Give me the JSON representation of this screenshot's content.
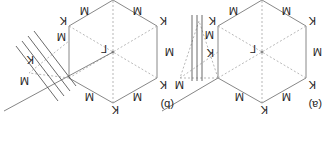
{
  "figure": {
    "orientation": "rotated-180",
    "panels": [
      {
        "id": "a",
        "label": "(a)",
        "center_label": "Γ",
        "vertex_label": "K",
        "edge_midpoint_label": "M",
        "cut_lines": "vertical (parallel to Γ-K... three parallel lines)",
        "triangle_labels": [
          "K",
          "M",
          "M",
          "M",
          "K"
        ]
      },
      {
        "id": "b",
        "label": "(b)",
        "center_label": "Γ",
        "vertex_label": "K",
        "edge_midpoint_label": "M",
        "cut_lines": "tilted (four parallel oblique lines)",
        "triangle_labels": [
          "K",
          "M",
          "M",
          "M",
          "K"
        ]
      }
    ],
    "colors": {
      "edge": "#888888",
      "dashed": "#999999",
      "cut_lines": "#444444",
      "text": "#222222"
    }
  }
}
